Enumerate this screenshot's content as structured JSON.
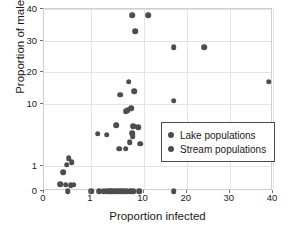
{
  "chart_data": {
    "type": "scatter",
    "title": "",
    "xlabel": "Proportion infected",
    "ylabel": "Proportion of males",
    "xscale": "symlog",
    "yscale": "symlog",
    "xticks": [
      0,
      1,
      10,
      20,
      30,
      40
    ],
    "yticks": [
      0,
      1,
      10,
      20,
      30,
      40
    ],
    "xticklabels": [
      "0",
      "1",
      "10",
      "20",
      "30",
      "40"
    ],
    "yticklabels": [
      "0",
      "1",
      "10",
      "20",
      "30",
      "40"
    ],
    "xlim": [
      0,
      42
    ],
    "ylim": [
      0,
      42
    ],
    "grid": true,
    "legend_position": "lower right",
    "marker_color": "#4d4d4d",
    "series": [
      {
        "name": "Lake populations",
        "marker": "circle",
        "color": "#4d4d4d",
        "points": [
          [
            6.0,
            38.0
          ],
          [
            11.0,
            38.0
          ],
          [
            7.0,
            33.0
          ],
          [
            17.0,
            28.0
          ],
          [
            24.0,
            28.0
          ],
          [
            39.0,
            17.0
          ],
          [
            5.2,
            17.0
          ],
          [
            3.6,
            13.0
          ],
          [
            6.6,
            14.0
          ],
          [
            17.0,
            11.0
          ],
          [
            5.8,
            8.5
          ],
          [
            5.0,
            8.0
          ],
          [
            4.6,
            7.6
          ],
          [
            3.0,
            4.6
          ],
          [
            6.4,
            4.4
          ],
          [
            7.8,
            4.2
          ],
          [
            6.0,
            3.4
          ],
          [
            6.2,
            3.0
          ],
          [
            1.35,
            3.3
          ],
          [
            2.0,
            3.2
          ],
          [
            5.4,
            2.4
          ],
          [
            3.4,
            1.9
          ],
          [
            4.6,
            1.9
          ],
          [
            8.6,
            2.3
          ],
          [
            0.22,
            1.35
          ],
          [
            0.28,
            1.15
          ],
          [
            0.18,
            1.05
          ],
          [
            0.12,
            0.52
          ]
        ]
      },
      {
        "name": "Stream populations",
        "marker": "circle",
        "color": "#4d4d4d",
        "points": [
          [
            0.08,
            0.06
          ],
          [
            0.16,
            0.05
          ],
          [
            0.26,
            0.04
          ],
          [
            0.34,
            0.05
          ],
          [
            0.2,
            0.0
          ],
          [
            1.0,
            0.0
          ],
          [
            1.45,
            0.0
          ],
          [
            1.75,
            0.0
          ],
          [
            2.0,
            0.0
          ],
          [
            2.2,
            0.0
          ],
          [
            2.45,
            0.0
          ],
          [
            2.7,
            0.0
          ],
          [
            2.95,
            0.0
          ],
          [
            3.2,
            0.0
          ],
          [
            3.5,
            0.0
          ],
          [
            3.8,
            0.0
          ],
          [
            4.3,
            0.0
          ],
          [
            4.8,
            0.0
          ],
          [
            5.6,
            0.0
          ],
          [
            6.3,
            0.0
          ],
          [
            8.2,
            0.0
          ],
          [
            17.0,
            0.0
          ]
        ]
      }
    ]
  },
  "legend": {
    "items": [
      {
        "label": "Lake populations"
      },
      {
        "label": "Stream populations"
      }
    ]
  }
}
